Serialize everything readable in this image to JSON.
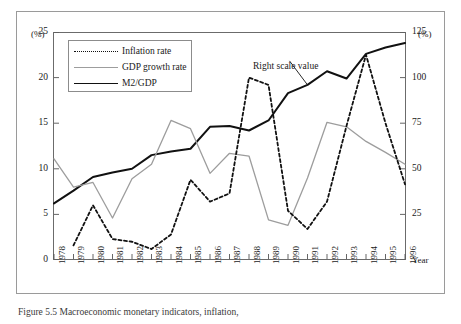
{
  "figure": {
    "caption": "Figure 5.5 Macroeconomic monetary indicators, inflation,",
    "annotation": "Right scale value",
    "left_axis_unit": "(%)",
    "right_axis_unit": "(%)",
    "x_axis_label": "Year"
  },
  "legend": {
    "items": [
      {
        "label": "Inflation rate",
        "key": "dashed-black"
      },
      {
        "label": "GDP growth rate",
        "key": "solid-gray"
      },
      {
        "label": "M2/GDP",
        "key": "solid-black"
      }
    ]
  },
  "colors": {
    "inflation": "#111111",
    "gdp_growth": "#9d9d9d",
    "m2_gdp": "#111111",
    "frame": "#9a9a9a",
    "axis": "#555555"
  },
  "chart_data": {
    "type": "line",
    "title": "",
    "xlabel": "Year",
    "ylabel": "(%)",
    "y2label": "(%)",
    "ylim": [
      0,
      25
    ],
    "y2lim": [
      0,
      125
    ],
    "yticks": [
      0,
      5,
      10,
      15,
      20,
      25
    ],
    "y2ticks": [
      0,
      25,
      50,
      75,
      100,
      125
    ],
    "grid": false,
    "legend_position": "top-left",
    "x": [
      1978,
      1979,
      1980,
      1981,
      1982,
      1983,
      1984,
      1985,
      1986,
      1987,
      1988,
      1989,
      1990,
      1991,
      1992,
      1993,
      1994,
      1995,
      1996
    ],
    "xticklabels": [
      "1978",
      "1979",
      "1980",
      "1981",
      "1982",
      "1983",
      "1984",
      "1985",
      "1986",
      "1987",
      "1988",
      "1989",
      "1990",
      "1991",
      "1992",
      "1993",
      "1994",
      "1995",
      "1996"
    ],
    "series": [
      {
        "name": "Inflation rate",
        "axis": "left",
        "style": "dashed",
        "color": "#111111",
        "values": [
          null,
          1.6,
          6.0,
          2.3,
          2.0,
          1.2,
          2.8,
          8.8,
          6.4,
          7.3,
          20.0,
          19.2,
          5.4,
          3.4,
          6.4,
          14.7,
          22.5,
          15.0,
          8.3
        ]
      },
      {
        "name": "GDP growth rate",
        "axis": "left",
        "style": "solid",
        "color": "#9d9d9d",
        "values": [
          11.1,
          8.0,
          8.5,
          4.6,
          8.9,
          10.5,
          15.3,
          14.4,
          9.5,
          11.7,
          11.4,
          4.4,
          3.8,
          9.0,
          15.1,
          14.6,
          13.0,
          11.8,
          10.5
        ]
      },
      {
        "name": "M2/GDP",
        "axis": "right",
        "style": "solid-thick",
        "color": "#111111",
        "values": [
          31.0,
          38.0,
          45.5,
          48.0,
          50.0,
          57.5,
          59.5,
          61.0,
          73.0,
          73.5,
          71.0,
          76.5,
          91.5,
          96.0,
          103.5,
          99.5,
          113.0,
          116.5,
          119.0
        ]
      }
    ],
    "annotations": [
      {
        "text": "Right scale value",
        "points_to_series": "M2/GDP",
        "points_to_x": 1991
      }
    ]
  }
}
